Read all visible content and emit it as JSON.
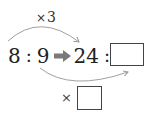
{
  "diagram": {
    "type": "ratio-equivalence",
    "top_operation": {
      "symbol": "×",
      "value": "3",
      "icon": "multiply-icon"
    },
    "left_ratio": {
      "first": "8",
      "separator": ":",
      "second": "9"
    },
    "transform_arrow_icon": "right-arrow-icon",
    "right_ratio": {
      "first": "24",
      "separator": ":",
      "second": ""
    },
    "bottom_operation": {
      "symbol": "×",
      "value": ""
    },
    "colors": {
      "text": "#222222",
      "arc": "#999999",
      "arrow": "#777777",
      "box_border": "#444444"
    }
  }
}
